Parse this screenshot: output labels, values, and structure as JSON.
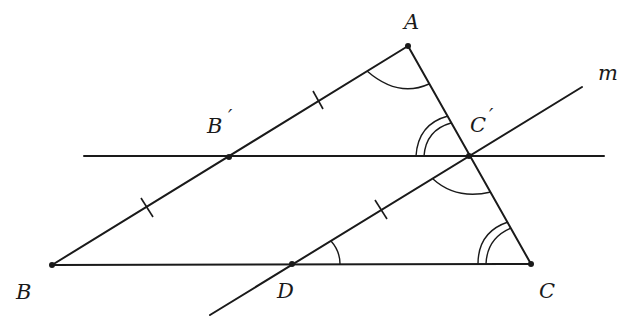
{
  "diagram": {
    "type": "geometry",
    "colors": {
      "stroke": "#1a1a1a",
      "background": "#ffffff"
    },
    "points": {
      "A": {
        "label": "A",
        "x": 408,
        "y": 46
      },
      "B": {
        "label": "B",
        "x": 52,
        "y": 265
      },
      "C": {
        "label": "C",
        "x": 531,
        "y": 264
      },
      "B_prime": {
        "label": "B",
        "prime": "′",
        "x": 229,
        "y": 157
      },
      "C_prime": {
        "label": "C",
        "prime": "′",
        "x": 469,
        "y": 156
      },
      "D": {
        "label": "D",
        "x": 292,
        "y": 264
      }
    },
    "lines": {
      "m": {
        "label": "m"
      }
    },
    "labels": {
      "A": "A",
      "B": "B",
      "C": "C",
      "D": "D",
      "B_prime": "B",
      "C_prime": "C",
      "prime": "′",
      "m": "m"
    },
    "segments": [
      {
        "name": "AB",
        "from": "A",
        "to": "B"
      },
      {
        "name": "AC",
        "from": "A",
        "to": "C"
      },
      {
        "name": "BC",
        "from": "B",
        "to": "C"
      }
    ],
    "tick_marks": [
      {
        "on": "AB'",
        "count": 1
      },
      {
        "on": "B'B",
        "count": 1
      },
      {
        "on": "DC'",
        "count": 1
      }
    ],
    "angle_marks": [
      {
        "vertex": "A",
        "arcs": 1
      },
      {
        "vertex": "C'",
        "between": "B'C' and C'A",
        "arcs": 2
      },
      {
        "vertex": "C'",
        "between": "C'D and C'C",
        "arcs": 1
      },
      {
        "vertex": "C",
        "arcs": 2
      },
      {
        "vertex": "D",
        "arcs": 1
      }
    ]
  }
}
